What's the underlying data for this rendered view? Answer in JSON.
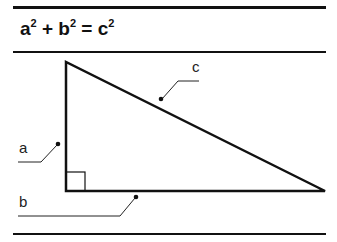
{
  "formula": {
    "a": "a",
    "b": "b",
    "c": "c",
    "exp": "2",
    "plus": " + ",
    "eq": " = "
  },
  "labels": {
    "a": "a",
    "b": "b",
    "c": "c"
  },
  "colors": {
    "line": "#111111",
    "background": "#ffffff"
  }
}
